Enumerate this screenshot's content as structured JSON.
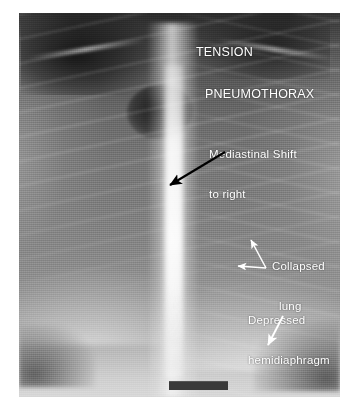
{
  "image": {
    "kind": "chest-radiograph",
    "modality_text": "TENSION PNEUMOTHORAX",
    "background_color": "#ffffff",
    "film_frame": {
      "left": 19,
      "top": 13,
      "width": 321,
      "height": 384
    }
  },
  "title": {
    "line1": "TENSION",
    "line2": "PNEUMOTHORAX",
    "color": "#ffffff"
  },
  "side_marker": {
    "text": "R",
    "color": "#ffffff"
  },
  "annotations": [
    {
      "id": "mediastinal-shift",
      "line1": "Mediastinal Shift",
      "line2": "to right",
      "arrow_color": "#000000",
      "arrow_from": [
        225,
        152
      ],
      "arrow_to": [
        168,
        186
      ]
    },
    {
      "id": "collapsed-lung",
      "line1": "Collapsed",
      "line2": "lung",
      "arrow_color": "#ffffff",
      "arrow_from": [
        266,
        268
      ],
      "arrow_to": [
        250,
        238
      ],
      "arrow2_from": [
        266,
        268
      ],
      "arrow2_to": [
        236,
        266
      ]
    },
    {
      "id": "depressed-hemidiaphragm",
      "line1": "Depressed",
      "line2": "hemidiaphragm",
      "arrow_color": "#ffffff",
      "arrow_from": [
        283,
        316
      ],
      "arrow_to": [
        266,
        348
      ]
    }
  ],
  "marker_bar": {
    "color": "#3a3a3a"
  }
}
